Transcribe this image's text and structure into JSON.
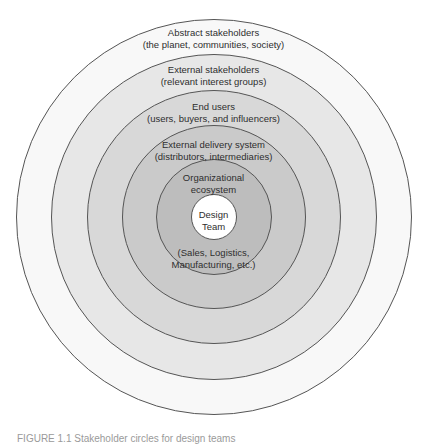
{
  "diagram": {
    "type": "concentric-circles",
    "center": {
      "x": 214,
      "y": 217
    },
    "stroke_color": "#555555",
    "layers": [
      {
        "id": "abstract-stakeholders",
        "title": "Abstract stakeholders",
        "subtitle": "(the planet, communities, society)",
        "radius": 198,
        "fill": "#f8f8f8"
      },
      {
        "id": "external-stakeholders",
        "title": "External stakeholders",
        "subtitle": "(relevant interest groups)",
        "radius": 163,
        "fill": "#e7e7e7"
      },
      {
        "id": "end-users",
        "title": "End users",
        "subtitle": "(users, buyers, and influencers)",
        "radius": 127,
        "fill": "#d8d8d8"
      },
      {
        "id": "external-delivery-system",
        "title": "External delivery system",
        "subtitle": "(distributors, intermediaries)",
        "radius": 92,
        "fill": "#cacaca"
      },
      {
        "id": "organizational-ecosystem",
        "title": "Organizational",
        "subtitle": "ecosystem",
        "note_line1": "(Sales, Logistics,",
        "note_line2": "Manufacturing, etc.)",
        "radius": 58,
        "fill": "#bdbdbd"
      },
      {
        "id": "design-team",
        "title": "Design",
        "subtitle": "Team",
        "radius": 23,
        "fill": "#ffffff"
      }
    ]
  },
  "caption": {
    "text": "FIGURE 1.1  Stakeholder circles for design teams"
  }
}
